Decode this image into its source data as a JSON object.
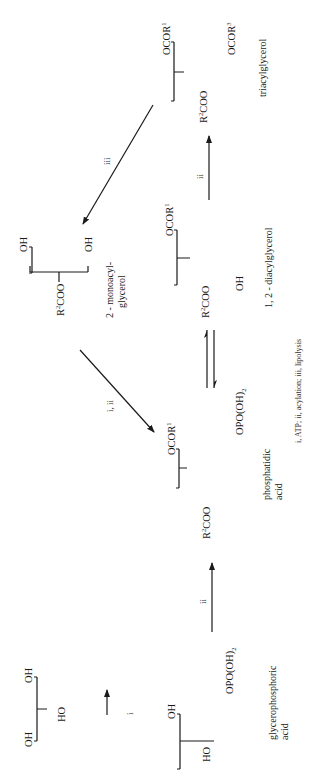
{
  "diagram": {
    "type": "reaction-scheme",
    "orientation": "rotated-90-ccw",
    "compounds": [
      {
        "id": "glycerol",
        "groups": {
          "top": "OH",
          "middle": "HO",
          "bottom": "OH"
        },
        "name": ""
      },
      {
        "id": "glycerophosphoric-acid",
        "groups": {
          "top": "OH",
          "middle": "HO",
          "bottom": "OPO(OH)",
          "bottom_sub": "2"
        },
        "name_line1": "glycerophosphoric",
        "name_line2": "acid"
      },
      {
        "id": "phosphatidic-acid",
        "groups": {
          "top": "OCOR",
          "top_sup": "1",
          "middle": "R",
          "middle_sup": "2",
          "middle_tail": "COO",
          "bottom": "OPO(OH)",
          "bottom_sub": "2"
        },
        "name_line1": "phosphatidic",
        "name_line2": "acid"
      },
      {
        "id": "diacylglycerol",
        "groups": {
          "top": "OCOR",
          "top_sup": "1",
          "middle": "R",
          "middle_sup": "2",
          "middle_tail": "COO",
          "bottom": "OH"
        },
        "name_line1": "1, 2 - diacylglycerol"
      },
      {
        "id": "triacylglycerol",
        "groups": {
          "top": "OCOR",
          "top_sup": "1",
          "middle": "R",
          "middle_sup": "2",
          "middle_tail": "COO",
          "bottom": "OCOR",
          "bottom_sup": "3"
        },
        "name_line1": "triacylglycerol"
      },
      {
        "id": "monoacylglycerol",
        "groups": {
          "top": "OH",
          "middle": "R",
          "middle_sup": "2",
          "middle_tail": "COO",
          "bottom": "OH"
        },
        "name_line1": "2 - monoacyl-",
        "name_line2": "glycerol"
      }
    ],
    "reactions": [
      {
        "from": "glycerol",
        "to": "glycerophosphoric-acid",
        "label": "i"
      },
      {
        "from": "glycerophosphoric-acid",
        "to": "phosphatidic-acid",
        "label": "ii"
      },
      {
        "from": "phosphatidic-acid",
        "to": "diacylglycerol",
        "label": "",
        "reversible": true
      },
      {
        "from": "diacylglycerol",
        "to": "triacylglycerol",
        "label": "ii"
      },
      {
        "from": "triacylglycerol",
        "to": "monoacylglycerol",
        "label": "iii"
      },
      {
        "from": "monoacylglycerol",
        "to": "phosphatidic-acid",
        "label": "i, ii"
      }
    ],
    "caption": "i, ATP; ii, acylation; iii, lipolysis"
  }
}
